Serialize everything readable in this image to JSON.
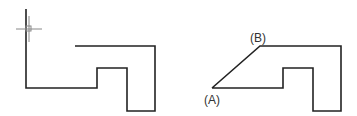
{
  "diagram": {
    "left_figure": {
      "description": "L-shaped outline with cursor crosshair at top of vertical line",
      "cursor_icon": "crosshair-cursor"
    },
    "right_figure": {
      "labels": {
        "a": "(A)",
        "b": "(B)"
      }
    },
    "colors": {
      "stroke": "#222222",
      "cursor": "#888888",
      "background": "#ffffff"
    }
  }
}
